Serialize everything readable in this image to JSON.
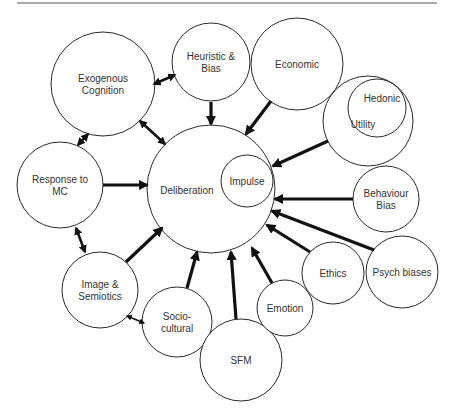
{
  "diagram": {
    "title": "",
    "rule": {
      "x1": 17,
      "x2": 437,
      "y": 3,
      "color": "#555555"
    },
    "nodes": [
      {
        "id": "exogenous",
        "label_lines": [
          "Exogenous",
          "Cognition"
        ],
        "cx": 103,
        "cy": 84,
        "r": 52
      },
      {
        "id": "heuristic",
        "label_lines": [
          "Heuristic &",
          "Bias"
        ],
        "cx": 211,
        "cy": 62,
        "r": 39
      },
      {
        "id": "economic",
        "label_lines": [
          "Economic"
        ],
        "cx": 297,
        "cy": 64,
        "r": 46
      },
      {
        "id": "utility",
        "label_lines": [
          "Utility"
        ],
        "cx": 368,
        "cy": 121,
        "r": 45
      },
      {
        "id": "hedonic",
        "label_lines": [
          "Hedonic"
        ],
        "cx": 377,
        "cy": 108,
        "r": 29
      },
      {
        "id": "response",
        "label_lines": [
          "Response to",
          "MC"
        ],
        "cx": 60,
        "cy": 185,
        "r": 43
      },
      {
        "id": "deliberation",
        "label_lines": [
          "Deliberation"
        ],
        "cx": 211,
        "cy": 189,
        "r": 64
      },
      {
        "id": "impulse",
        "label_lines": [
          "Impulse"
        ],
        "cx": 247,
        "cy": 181,
        "r": 26
      },
      {
        "id": "behaviour",
        "label_lines": [
          "Behaviour",
          "Bias"
        ],
        "cx": 386,
        "cy": 199,
        "r": 33
      },
      {
        "id": "image",
        "label_lines": [
          "Image &",
          "Semiotics"
        ],
        "cx": 100,
        "cy": 290,
        "r": 38
      },
      {
        "id": "socio",
        "label_lines": [
          "Socio-",
          "cultural"
        ],
        "cx": 177,
        "cy": 322,
        "r": 35
      },
      {
        "id": "sfm",
        "label_lines": [
          "SFM"
        ],
        "cx": 241,
        "cy": 360,
        "r": 41
      },
      {
        "id": "emotion",
        "label_lines": [
          "Emotion"
        ],
        "cx": 285,
        "cy": 308,
        "r": 28
      },
      {
        "id": "ethics",
        "label_lines": [
          "Ethics"
        ],
        "cx": 333,
        "cy": 273,
        "r": 31
      },
      {
        "id": "psych",
        "label_lines": [
          "Psych biases"
        ],
        "cx": 402,
        "cy": 272,
        "r": 36
      }
    ],
    "edges": [
      {
        "from": "heuristic",
        "to": "deliberation",
        "type": "directed",
        "x1": 211,
        "y1": 102,
        "x2": 211,
        "y2": 124
      },
      {
        "from": "economic",
        "to": "deliberation",
        "type": "directed",
        "x1": 271,
        "y1": 101,
        "x2": 246,
        "y2": 134
      },
      {
        "from": "utility",
        "to": "deliberation",
        "type": "directed",
        "x1": 328,
        "y1": 141,
        "x2": 273,
        "y2": 166
      },
      {
        "from": "behaviour",
        "to": "deliberation",
        "type": "directed",
        "x1": 353,
        "y1": 199,
        "x2": 275,
        "y2": 199
      },
      {
        "from": "psych",
        "to": "deliberation",
        "type": "directed",
        "x1": 374,
        "y1": 250,
        "x2": 272,
        "y2": 211
      },
      {
        "from": "ethics",
        "to": "deliberation",
        "type": "directed",
        "x1": 310,
        "y1": 252,
        "x2": 267,
        "y2": 225
      },
      {
        "from": "emotion",
        "to": "deliberation",
        "type": "directed",
        "x1": 272,
        "y1": 283,
        "x2": 252,
        "y2": 248
      },
      {
        "from": "sfm",
        "to": "deliberation",
        "type": "directed",
        "x1": 236,
        "y1": 319,
        "x2": 231,
        "y2": 252
      },
      {
        "from": "socio",
        "to": "deliberation",
        "type": "directed",
        "x1": 187,
        "y1": 288,
        "x2": 197,
        "y2": 252
      },
      {
        "from": "image",
        "to": "deliberation",
        "type": "directed",
        "x1": 126,
        "y1": 262,
        "x2": 162,
        "y2": 228
      },
      {
        "from": "response",
        "to": "deliberation",
        "type": "directed",
        "x1": 103,
        "y1": 185,
        "x2": 147,
        "y2": 185
      },
      {
        "from": "exogenous",
        "to": "heuristic",
        "type": "bidirectional",
        "x1": 154,
        "y1": 84,
        "x2": 175,
        "y2": 75
      },
      {
        "from": "exogenous",
        "to": "deliberation",
        "type": "bidirectional",
        "x1": 140,
        "y1": 121,
        "x2": 165,
        "y2": 144
      },
      {
        "from": "exogenous",
        "to": "response",
        "type": "bidirectional",
        "x1": 88,
        "y1": 134,
        "x2": 78,
        "y2": 145
      },
      {
        "from": "response",
        "to": "image",
        "type": "bidirectional",
        "x1": 76,
        "y1": 228,
        "x2": 85,
        "y2": 252
      },
      {
        "from": "image",
        "to": "socio",
        "type": "bidirectional-thin",
        "x1": 127,
        "y1": 316,
        "x2": 144,
        "y2": 323
      }
    ]
  }
}
